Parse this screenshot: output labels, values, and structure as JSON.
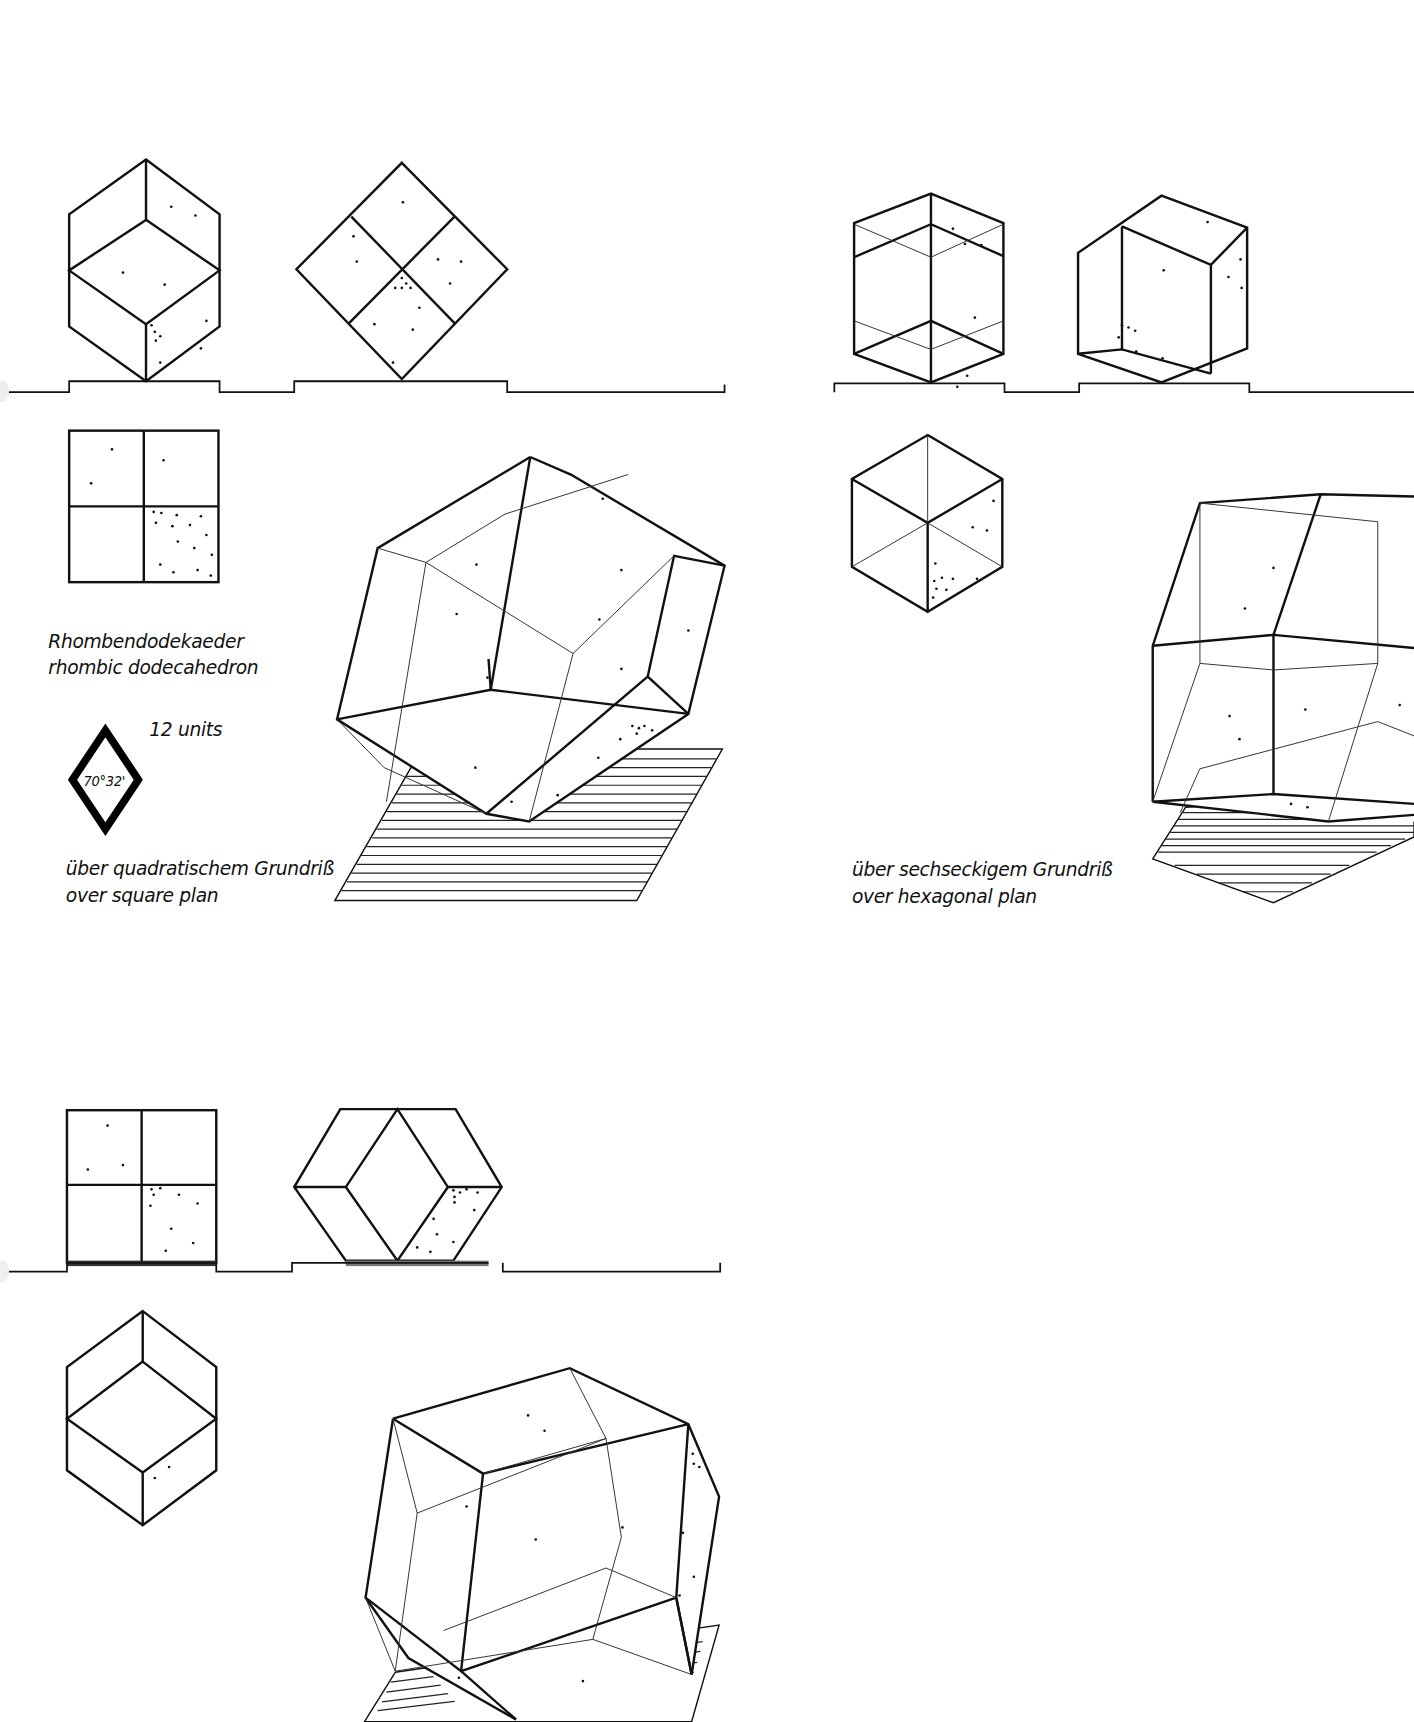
{
  "title": {
    "german": "Rhombendodekaeder",
    "english": "rhombic dodecahedron"
  },
  "unit_badge": {
    "units_label": "12 units",
    "angle_label": "70°32'"
  },
  "panels": [
    {
      "id": "square-plan",
      "caption_german": "über quadratischem Grundriß",
      "caption_english": "over square plan"
    },
    {
      "id": "hexagonal-plan",
      "caption_german": "über sechseckigem Grundriß",
      "caption_english": "over hexagonal plan"
    },
    {
      "id": "square-plan-variant",
      "caption_german": "",
      "caption_english": ""
    }
  ],
  "colors": {
    "ink": "#111111",
    "paper": "#ffffff"
  }
}
